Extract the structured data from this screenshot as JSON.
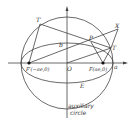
{
  "diagram": {
    "colors": {
      "line": "#444444",
      "text": "#333333",
      "background": "#ffffff",
      "point": "#111111"
    },
    "labels": {
      "T_prime": "T′",
      "X": "X",
      "P": "P",
      "T": "T",
      "b": "b",
      "O": "O",
      "F_prime": "F′(−ae,0)",
      "F": "F(ae,0)",
      "a": "a",
      "E": "E",
      "aux_line1": "auxiliary",
      "aux_line2": "circle"
    },
    "points": {
      "O": [
        67,
        63
      ],
      "F_prime": [
        29,
        63
      ],
      "F": [
        103,
        63
      ],
      "T_prime": [
        40,
        24
      ],
      "P": [
        91,
        42
      ],
      "T": [
        111,
        48
      ],
      "X": [
        118,
        29
      ]
    },
    "circle": {
      "cx": 67,
      "cy": 63,
      "r": 46
    },
    "ellipse": {
      "cx": 67,
      "cy": 63,
      "rx": 46,
      "ry": 20
    }
  }
}
